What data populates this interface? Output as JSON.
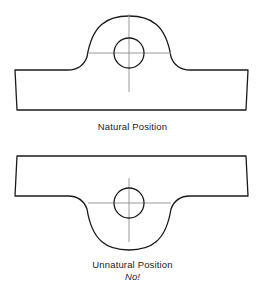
{
  "figure": {
    "title_top": "Natural Position",
    "title_bottom": "Unnatural Position",
    "annotation_bottom": "No!",
    "colors": {
      "outline": "#1a1a1a",
      "centerline": "#9a9a9a",
      "background": "#ffffff"
    },
    "views": [
      {
        "name": "natural-position",
        "description": "Bracket with domed boss and bolt hole, boss oriented upward",
        "orientation": "boss-up",
        "label": "Natural Position",
        "hole": {
          "cx": 129,
          "cy": 53,
          "r": 15
        },
        "centerline_horizontal": {
          "x1": 88,
          "x2": 171,
          "y": 53
        },
        "centerline_vertical": {
          "x": 129,
          "y1": 14,
          "y2": 92
        },
        "plate": {
          "top": 70,
          "bottom": 110,
          "left": 15,
          "right": 248
        },
        "dome": {
          "top": 19,
          "radius": 40
        }
      },
      {
        "name": "unnatural-position",
        "description": "Same bracket inverted, boss oriented downward",
        "orientation": "boss-down",
        "label": "Unnatural Position",
        "annotation": "No!",
        "hole": {
          "cx": 129,
          "cy": 203,
          "r": 15
        },
        "centerline_horizontal": {
          "x1": 88,
          "x2": 171,
          "y": 203
        },
        "centerline_vertical": {
          "x": 129,
          "y1": 178,
          "y2": 242
        },
        "plate": {
          "top": 156,
          "bottom": 196,
          "left": 15,
          "right": 248
        },
        "dome": {
          "bottom": 237,
          "radius": 40
        }
      }
    ]
  }
}
